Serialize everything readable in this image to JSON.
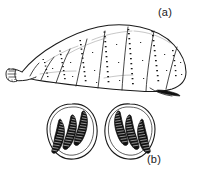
{
  "figure": {
    "caption_labels": {
      "larva": "(a)",
      "spiracles": "(b)"
    },
    "colors": {
      "background": "#ffffff",
      "ink": "#1a1a1a",
      "fill_light": "#ffffff",
      "fill_dark": "#111111"
    },
    "panels": [
      {
        "id": "a",
        "label": "(a)",
        "subject": "fly-larva-lateral-view",
        "description": "Segmented maggot body in lateral view, anterior narrow end at lower left, broad posterior at right, with rows of small spines along segment margins and a dark posterior spiracular wedge.",
        "segment_count": 8,
        "spine_rows": 6
      },
      {
        "id": "b",
        "label": "(b)",
        "subject": "posterior-spiracular-plates",
        "description": "Pair of mirrored oval spiracular plates, each enclosing three sinuous dark respiratory slits with ladder-like cross striations.",
        "plate_count": 2,
        "slits_per_plate": 3
      }
    ]
  }
}
